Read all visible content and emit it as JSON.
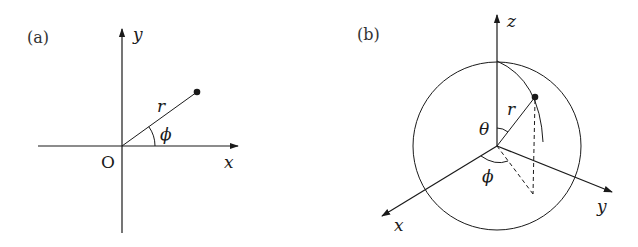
{
  "diagram": {
    "panel_a": {
      "label": "(a)",
      "title": "Polar coordinates",
      "axis_x_label": "x",
      "axis_y_label": "y",
      "origin_label": "O",
      "radius_label": "r",
      "angle_label": "ϕ"
    },
    "panel_b": {
      "label": "(b)",
      "title": "Spherical coordinates",
      "axis_x_label": "x",
      "axis_y_label": "y",
      "axis_z_label": "z",
      "radius_label": "r",
      "polar_angle_label": "θ",
      "azimuth_label": "ϕ"
    },
    "colors": {
      "ink": "#1a1a1a",
      "background": "#ffffff"
    }
  }
}
